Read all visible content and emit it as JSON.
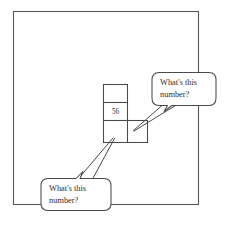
{
  "figure": {
    "background_color": "#ffffff",
    "line_color": "#4a4a4a",
    "frame_color": "#5a5a5a",
    "text_color": "#2e2e2e"
  },
  "grid": {
    "cells": [
      {
        "id": "cell-top",
        "value": ""
      },
      {
        "id": "cell-middle",
        "value": "56"
      },
      {
        "id": "cell-bottom-left",
        "value": ""
      },
      {
        "id": "cell-bottom-right",
        "value": ""
      }
    ],
    "known_value": "56"
  },
  "callouts": [
    {
      "id": "callout-top-right",
      "line1": "What's this",
      "line2": "number?",
      "points_to": "cell-bottom-right"
    },
    {
      "id": "callout-bottom-left",
      "line1": "What's this",
      "line2": "number?",
      "points_to": "cell-bottom-left"
    }
  ]
}
